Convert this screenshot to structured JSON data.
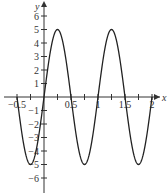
{
  "chart_data": {
    "type": "line",
    "title": "",
    "xlabel": "x",
    "ylabel": "y",
    "function": "y = 5 sin(2πx)",
    "xlim": [
      -0.5,
      2
    ],
    "ylim": [
      -6.5,
      6.5
    ],
    "grid": false,
    "x_ticks": [
      -0.5,
      -0.25,
      0.25,
      0.5,
      0.75,
      1,
      1.25,
      1.5,
      1.75,
      2
    ],
    "x_tick_labels": [
      "-0.5",
      "0.5",
      "1",
      "1.5",
      "2"
    ],
    "y_ticks": [
      -6,
      -5,
      -4,
      -3,
      -2,
      -1,
      1,
      2,
      3,
      4,
      5,
      6
    ],
    "y_tick_labels": [
      "-6",
      "-5",
      "-4",
      "-3",
      "-2",
      "-1",
      "1",
      "2",
      "3",
      "4",
      "5",
      "6"
    ],
    "series": [
      {
        "name": "5 sin(2πx)",
        "x": [
          -0.5,
          -0.25,
          0,
          0.25,
          0.5,
          0.75,
          1,
          1.25,
          1.5,
          1.75,
          2
        ],
        "y": [
          0,
          -5,
          0,
          5,
          0,
          -5,
          0,
          5,
          0,
          -5,
          0
        ],
        "color": "#222222"
      }
    ]
  },
  "axes": {
    "x_label": "x",
    "y_label": "y"
  },
  "colors": {
    "axis": "#333333",
    "curve": "#222222",
    "background": "#ffffff"
  }
}
